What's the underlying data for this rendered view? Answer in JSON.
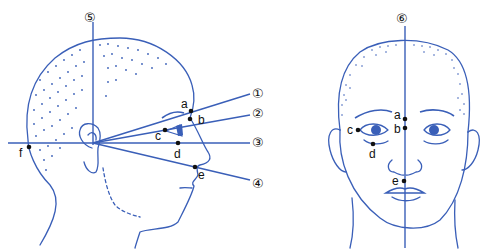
{
  "diagram": {
    "colors": {
      "line": "#3a5fb8",
      "point": "#111111",
      "background": "#ffffff"
    },
    "side_view": {
      "lines": [
        {
          "id": "1",
          "label": "①"
        },
        {
          "id": "2",
          "label": "②"
        },
        {
          "id": "3",
          "label": "③"
        },
        {
          "id": "4",
          "label": "④"
        },
        {
          "id": "5",
          "label": "⑤"
        }
      ],
      "points": [
        {
          "id": "a",
          "label": "a"
        },
        {
          "id": "b",
          "label": "b"
        },
        {
          "id": "c",
          "label": "c"
        },
        {
          "id": "d",
          "label": "d"
        },
        {
          "id": "e",
          "label": "e"
        },
        {
          "id": "f",
          "label": "f"
        }
      ]
    },
    "front_view": {
      "lines": [
        {
          "id": "6",
          "label": "⑥"
        }
      ],
      "points": [
        {
          "id": "a",
          "label": "a"
        },
        {
          "id": "b",
          "label": "b"
        },
        {
          "id": "c",
          "label": "c"
        },
        {
          "id": "d",
          "label": "d"
        },
        {
          "id": "e",
          "label": "e"
        }
      ]
    }
  }
}
